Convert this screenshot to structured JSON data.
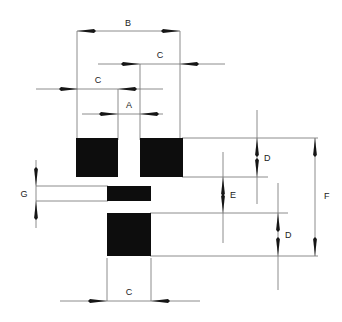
{
  "diagram": {
    "type": "engineering-dimension-drawing",
    "title": "",
    "background_color": "#ffffff",
    "pad_color": "#0d0d0d",
    "line_color": "#6e6e6e",
    "arrow_color": "#161616",
    "label_color": "#1a1a1a",
    "pads": [
      {
        "id": "pad-top-left",
        "name": "top-left-pad",
        "x": 76,
        "y": 138,
        "w": 42,
        "h": 39
      },
      {
        "id": "pad-top-right",
        "name": "top-right-pad",
        "x": 140,
        "y": 138,
        "w": 43,
        "h": 39
      },
      {
        "id": "pad-middle",
        "name": "middle-pad",
        "x": 107,
        "y": 186,
        "w": 44,
        "h": 15
      },
      {
        "id": "pad-bottom",
        "name": "bottom-pad",
        "x": 107,
        "y": 213,
        "w": 44,
        "h": 43
      }
    ],
    "dimensions": [
      {
        "id": "dim-b",
        "label": "B",
        "name": "dimension-b",
        "orientation": "horizontal",
        "measures": "overall width across both top pads",
        "from": 77,
        "to": 180,
        "at": 31,
        "label_x": 128,
        "label_y": 26
      },
      {
        "id": "dim-c-upper",
        "label": "C",
        "name": "dimension-c-upper",
        "orientation": "horizontal",
        "measures": "width of top-right pad",
        "from": 140,
        "to": 180,
        "at": 64,
        "label_x": 160,
        "label_y": 58
      },
      {
        "id": "dim-c-left",
        "label": "C",
        "name": "dimension-c-left",
        "orientation": "horizontal",
        "measures": "width of top-left pad",
        "from": 78,
        "to": 118,
        "at": 89,
        "label_x": 98,
        "label_y": 83
      },
      {
        "id": "dim-a",
        "label": "A",
        "name": "dimension-a",
        "orientation": "horizontal",
        "measures": "gap between the two top pads",
        "from": 118,
        "to": 140,
        "at": 114,
        "label_x": 129,
        "label_y": 108
      },
      {
        "id": "dim-g",
        "label": "G",
        "name": "dimension-g",
        "orientation": "vertical",
        "measures": "height of middle pad",
        "from": 186,
        "to": 201,
        "at": 36,
        "label_x": 24,
        "label_y": 197
      },
      {
        "id": "dim-d-upper",
        "label": "D",
        "name": "dimension-d-upper",
        "orientation": "vertical",
        "measures": "height of top pads",
        "from": 138,
        "to": 177,
        "at": 257,
        "label_x": 264,
        "label_y": 161
      },
      {
        "id": "dim-e",
        "label": "E",
        "name": "dimension-e",
        "orientation": "vertical",
        "measures": "vertical gap between top pads and bottom pad",
        "from": 177,
        "to": 213,
        "at": 223,
        "label_x": 230,
        "label_y": 198
      },
      {
        "id": "dim-d-lower",
        "label": "D",
        "name": "dimension-d-lower",
        "orientation": "vertical",
        "measures": "height of bottom pad",
        "from": 213,
        "to": 256,
        "at": 278,
        "label_x": 285,
        "label_y": 238
      },
      {
        "id": "dim-f",
        "label": "F",
        "name": "dimension-f",
        "orientation": "vertical",
        "measures": "overall height from top pads to bottom pad",
        "from": 138,
        "to": 256,
        "at": 315,
        "label_x": 324,
        "label_y": 199
      },
      {
        "id": "dim-c-bottom",
        "label": "C",
        "name": "dimension-c-bottom",
        "orientation": "horizontal",
        "measures": "width of bottom pad",
        "from": 107,
        "to": 151,
        "at": 301,
        "label_x": 129,
        "label_y": 295
      }
    ]
  }
}
